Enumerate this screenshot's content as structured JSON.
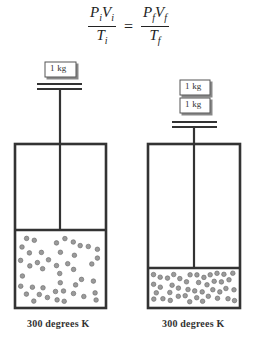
{
  "equation": {
    "lhs_num": {
      "a": "P",
      "a_sub": "i",
      "b": "V",
      "b_sub": "i"
    },
    "lhs_den": {
      "a": "T",
      "a_sub": "i"
    },
    "equals": "=",
    "rhs_num": {
      "a": "P",
      "a_sub": "f",
      "b": "V",
      "b_sub": "f"
    },
    "rhs_den": {
      "a": "T",
      "a_sub": "f"
    }
  },
  "left_cylinder": {
    "weights": [
      "1 kg"
    ],
    "temperature_label": "300 degrees K"
  },
  "right_cylinder": {
    "weights": [
      "1 kg",
      "1 kg"
    ],
    "temperature_label": "300 degrees K"
  },
  "colors": {
    "stroke": "#333333",
    "particle_fill": "#9a9a9a",
    "particle_stroke": "#666666"
  }
}
